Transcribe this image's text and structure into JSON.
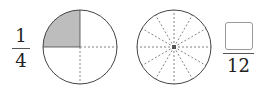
{
  "left_fraction": {
    "numerator": "1",
    "denominator": "4"
  },
  "right_fraction": {
    "numerator": "",
    "denominator": "12"
  },
  "circle_left": {
    "parts": 4,
    "shaded_parts": 1,
    "shade_color": "#bdbdbd"
  },
  "circle_right": {
    "parts": 12,
    "shaded_parts": 0
  },
  "colors": {
    "stroke": "#444444",
    "dash": "#666666",
    "box_border": "#999999"
  }
}
